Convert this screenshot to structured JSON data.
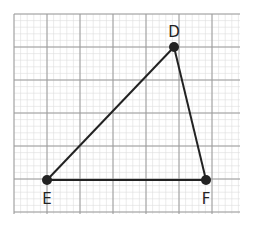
{
  "diagram": {
    "type": "triangle-on-grid",
    "grid": {
      "x0": 14,
      "y0": 14,
      "x1": 240,
      "y1": 214,
      "major": 33,
      "minor": 6.6,
      "major_color": "#9a9a9a",
      "minor_color": "#dddddd"
    },
    "points": [
      {
        "name": "D",
        "x": 174,
        "y": 47,
        "label_dx": 0,
        "label_dy": -10
      },
      {
        "name": "E",
        "x": 47,
        "y": 180,
        "label_dx": 0,
        "label_dy": 24
      },
      {
        "name": "F",
        "x": 206,
        "y": 180,
        "label_dx": 0,
        "label_dy": 24
      }
    ],
    "segments": [
      [
        "D",
        "E"
      ],
      [
        "E",
        "F"
      ],
      [
        "F",
        "D"
      ]
    ],
    "line_color": "#222222"
  }
}
